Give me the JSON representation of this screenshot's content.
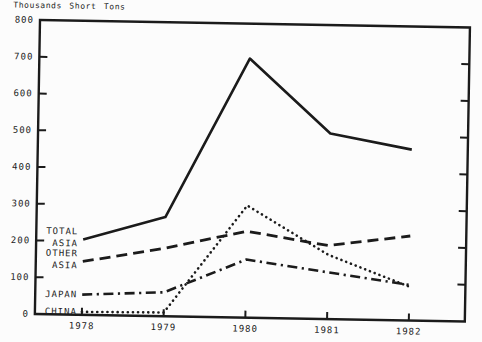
{
  "chart_data": {
    "type": "line",
    "title": "Thousands Short Tons",
    "xlabel": "",
    "ylabel": "Thousands Short Tons",
    "categories": [
      "1978",
      "1979",
      "1980",
      "1981",
      "1982"
    ],
    "ylim": [
      0,
      800
    ],
    "yticks": [
      0,
      100,
      200,
      300,
      400,
      500,
      600,
      700,
      800
    ],
    "grid": false,
    "legend_position": "inline-left",
    "ink_color": "#1b1b1b",
    "series": [
      {
        "name": "TOTAL ASIA",
        "label_lines": [
          "TOTAL",
          "ASIA"
        ],
        "line_style": "solid",
        "values": [
          205,
          270,
          705,
          505,
          465
        ]
      },
      {
        "name": "OTHER ASIA",
        "label_lines": [
          "OTHER",
          "ASIA"
        ],
        "line_style": "dashed",
        "values": [
          145,
          185,
          235,
          200,
          230
        ]
      },
      {
        "name": "JAPAN",
        "label_lines": [
          "JAPAN"
        ],
        "line_style": "dashdot",
        "values": [
          55,
          65,
          158,
          127,
          97
        ]
      },
      {
        "name": "CHINA",
        "label_lines": [
          "CHINA"
        ],
        "line_style": "dotted",
        "values": [
          8,
          10,
          305,
          175,
          92
        ]
      }
    ]
  }
}
